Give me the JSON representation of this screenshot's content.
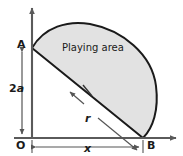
{
  "figure": {
    "type": "geometry-diagram",
    "region_label": "Playing area",
    "points": {
      "origin_label": "O",
      "top_label": "A",
      "right_label": "B"
    },
    "dimensions": {
      "vertical_label": "2a",
      "horizontal_label": "x",
      "radius_label": "r"
    },
    "colors": {
      "area_fill": "#e2e2e2",
      "area_stroke": "#1a1a1a",
      "axis": "#5a5a5a",
      "dimension_line": "#6e6e6e",
      "text": "#1a1a1a",
      "background": "#ffffff"
    },
    "geometry": {
      "origin_px": [
        32,
        138
      ],
      "point_A_px": [
        32,
        48
      ],
      "point_B_px": [
        143,
        138
      ],
      "arc_apex_px": [
        86,
        24
      ],
      "arc_right_px": [
        156,
        86
      ],
      "vertical_axis_x": 32,
      "horizontal_axis_y": 138
    }
  }
}
